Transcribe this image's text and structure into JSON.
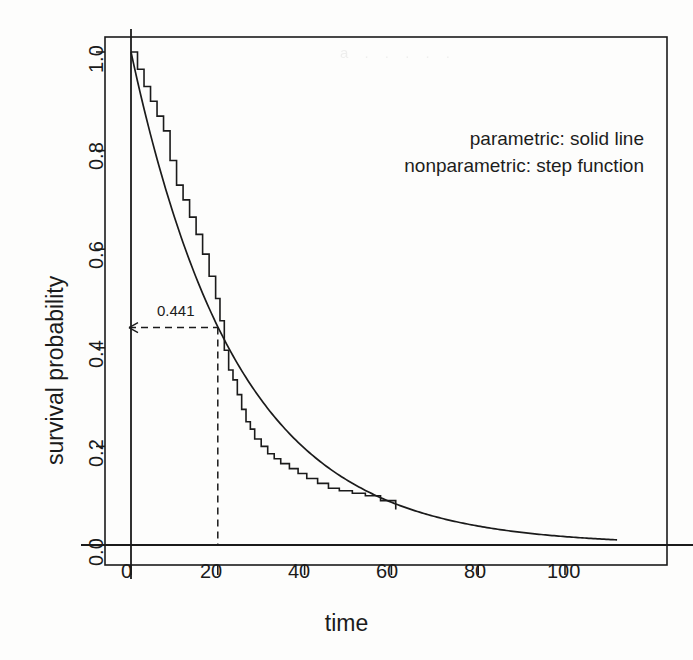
{
  "figure": {
    "background_color": "#fdfdfc",
    "ink_color": "#1b1b1b",
    "scan_artifact_text": "a  .  .  .  .  ."
  },
  "axes": {
    "x_title": "time",
    "y_title": "survival probability",
    "x_ticks": [
      "0",
      "20",
      "40",
      "60",
      "80",
      "100"
    ],
    "y_ticks": [
      "0.0",
      "0.2",
      "0.4",
      "0.6",
      "0.8",
      "1.0"
    ]
  },
  "legend": {
    "line1": "parametric:  solid line",
    "line2": "nonparametric:  step function"
  },
  "annotation": {
    "value_label": "0.441",
    "at_time": "20"
  },
  "chart_data": {
    "type": "line",
    "title": "",
    "xlabel": "time",
    "ylabel": "survival probability",
    "xlim": [
      -3,
      112
    ],
    "ylim": [
      -0.03,
      1.03
    ],
    "grid": false,
    "legend_position": "top-right",
    "annotations": [
      {
        "text": "0.441",
        "x": 20,
        "y": 0.441,
        "style": "dashed-crosshair-with-left-arrow"
      }
    ],
    "series": [
      {
        "name": "parametric: solid line",
        "style": "solid",
        "model": "exponential survival S(t) = exp(-0.0409 t)",
        "x": [
          0,
          2,
          4,
          6,
          8,
          10,
          12,
          14,
          16,
          18,
          20,
          24,
          28,
          32,
          36,
          40,
          44,
          48,
          52,
          56,
          60,
          65,
          70,
          75,
          80,
          85,
          90,
          95,
          100
        ],
        "values": [
          1.0,
          0.921,
          0.849,
          0.782,
          0.721,
          0.664,
          0.612,
          0.564,
          0.519,
          0.479,
          0.441,
          0.375,
          0.318,
          0.27,
          0.23,
          0.195,
          0.166,
          0.141,
          0.12,
          0.102,
          0.086,
          0.07,
          0.057,
          0.047,
          0.038,
          0.031,
          0.025,
          0.021,
          0.017
        ]
      },
      {
        "name": "nonparametric: step function",
        "style": "step",
        "model": "Kaplan-Meier estimate",
        "x": [
          0,
          1.5,
          3.0,
          4.5,
          6.0,
          7.5,
          9.0,
          10.5,
          12.0,
          13.5,
          15.0,
          16.5,
          18.0,
          19.5,
          20.5,
          21.5,
          22.5,
          23.5,
          24.5,
          25.5,
          26.5,
          27.5,
          28.5,
          30.0,
          31.5,
          33.0,
          34.5,
          36.5,
          38.5,
          40.5,
          43.0,
          45.5,
          48.0,
          51.0,
          54.0,
          57.5,
          61.0
        ],
        "values": [
          1.0,
          0.965,
          0.93,
          0.9,
          0.87,
          0.84,
          0.78,
          0.73,
          0.7,
          0.665,
          0.63,
          0.59,
          0.545,
          0.5,
          0.455,
          0.395,
          0.355,
          0.335,
          0.305,
          0.275,
          0.25,
          0.235,
          0.215,
          0.2,
          0.185,
          0.175,
          0.165,
          0.155,
          0.145,
          0.135,
          0.125,
          0.115,
          0.11,
          0.105,
          0.1,
          0.09,
          0.072
        ]
      }
    ]
  }
}
